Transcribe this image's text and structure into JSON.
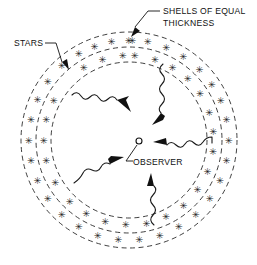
{
  "figure": {
    "background_color": "#ffffff",
    "ink_color": "#111111"
  },
  "labels": {
    "shells_line1": "SHELLS OF EQUAL",
    "shells_line2": "THICKNESS",
    "stars": "STARS",
    "observer": "OBSERVER"
  },
  "icons": {
    "star": "✳",
    "observer_marker": "observer-circle-icon"
  },
  "chart_data": {
    "type": "scatter",
    "xlabel": "",
    "ylabel": "",
    "center": {
      "x": 129,
      "y": 140
    },
    "shells": [
      {
        "name": "inner-shell-boundary",
        "radius": 78,
        "dashed": true
      },
      {
        "name": "middle-shell-boundary",
        "radius": 93,
        "dashed": true
      },
      {
        "name": "outer-shell-boundary",
        "radius": 108,
        "dashed": true
      }
    ],
    "star_band_radii": [
      85,
      100
    ],
    "stars": [
      {
        "r": 85,
        "a": -86
      },
      {
        "r": 85,
        "a": -72
      },
      {
        "r": 85,
        "a": -59
      },
      {
        "r": 85,
        "a": -46
      },
      {
        "r": 85,
        "a": -33
      },
      {
        "r": 85,
        "a": -19
      },
      {
        "r": 85,
        "a": -6
      },
      {
        "r": 85,
        "a": 8
      },
      {
        "r": 85,
        "a": 22
      },
      {
        "r": 85,
        "a": 36
      },
      {
        "r": 85,
        "a": 50
      },
      {
        "r": 85,
        "a": 64
      },
      {
        "r": 85,
        "a": 78
      },
      {
        "r": 85,
        "a": 92
      },
      {
        "r": 85,
        "a": 106
      },
      {
        "r": 85,
        "a": 120
      },
      {
        "r": 85,
        "a": 134
      },
      {
        "r": 85,
        "a": 150
      },
      {
        "r": 85,
        "a": 166
      },
      {
        "r": 85,
        "a": 180
      },
      {
        "r": 85,
        "a": 194
      },
      {
        "r": 85,
        "a": 208
      },
      {
        "r": 85,
        "a": 238
      },
      {
        "r": 85,
        "a": 252
      },
      {
        "r": 85,
        "a": 266
      },
      {
        "r": 100,
        "a": -88
      },
      {
        "r": 100,
        "a": -79
      },
      {
        "r": 100,
        "a": -68
      },
      {
        "r": 100,
        "a": -57
      },
      {
        "r": 100,
        "a": -45
      },
      {
        "r": 100,
        "a": -34
      },
      {
        "r": 100,
        "a": -23
      },
      {
        "r": 100,
        "a": -12
      },
      {
        "r": 100,
        "a": 0
      },
      {
        "r": 100,
        "a": 12
      },
      {
        "r": 100,
        "a": 24
      },
      {
        "r": 100,
        "a": 36
      },
      {
        "r": 100,
        "a": 48
      },
      {
        "r": 100,
        "a": 60
      },
      {
        "r": 100,
        "a": 72
      },
      {
        "r": 100,
        "a": 84
      },
      {
        "r": 100,
        "a": 96
      },
      {
        "r": 100,
        "a": 108
      },
      {
        "r": 100,
        "a": 120
      },
      {
        "r": 100,
        "a": 132
      },
      {
        "r": 100,
        "a": 144
      },
      {
        "r": 100,
        "a": 156
      },
      {
        "r": 100,
        "a": 168
      },
      {
        "r": 100,
        "a": 180
      },
      {
        "r": 100,
        "a": 192
      },
      {
        "r": 100,
        "a": 204
      },
      {
        "r": 100,
        "a": 216
      },
      {
        "r": 100,
        "a": 228
      },
      {
        "r": 100,
        "a": 240
      },
      {
        "r": 100,
        "a": 250
      },
      {
        "r": 100,
        "a": 260
      },
      {
        "r": 100,
        "a": 270
      }
    ],
    "rays": [
      {
        "name": "ray-upper-left",
        "from_angle": 208,
        "to_observer": true
      },
      {
        "name": "ray-upper-right",
        "from_angle": 285,
        "to_observer": true
      },
      {
        "name": "ray-right",
        "from_angle": 0,
        "to_observer": true
      },
      {
        "name": "ray-lower-left",
        "from_angle": 160,
        "to_observer": true
      },
      {
        "name": "ray-bottom",
        "from_angle": 90,
        "to_observer": true
      }
    ],
    "legend": [],
    "grid": false,
    "annotations": [
      {
        "text": "SHELLS OF EQUAL THICKNESS",
        "points_to": "outer-shell-boundary"
      },
      {
        "text": "STARS",
        "points_to": "star-in-outer-band"
      },
      {
        "text": "OBSERVER",
        "points_to": "center"
      }
    ]
  }
}
